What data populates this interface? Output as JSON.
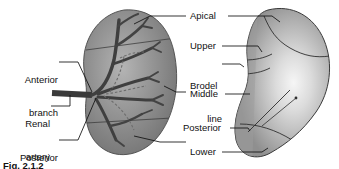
{
  "figure": {
    "title_caption": "Fig. 2.1.2",
    "background_color": "#ffffff",
    "ink_color": "#111111"
  },
  "labels": {
    "anterior_branch_line1": "Anterior",
    "anterior_branch_line2": "branch",
    "renal_artery_line1": "Renal",
    "renal_artery_line2": "artery",
    "posterior_branch_line1": "Posterior",
    "posterior_branch_line2": "branch",
    "apical": "Apical",
    "upper": "Upper",
    "brodel_line1": "Brodel",
    "brodel_line2": "line",
    "middle": "Middle",
    "posterior": "Posterior",
    "lower": "Lower"
  },
  "colors": {
    "kidney_mid_gray": "#8d8d8d",
    "kidney_dark_gray": "#6f6f6f",
    "kidney_light_gray": "#b9b9b9",
    "kidney_highlight": "#f4f4f4",
    "kidney_right_edge": "#9b9b9b",
    "vessel_dark": "#3a3a3a",
    "vessel_mid": "#4f4f4f",
    "outline": "#2b2b2b",
    "leader_line": "#1a1a1a"
  }
}
